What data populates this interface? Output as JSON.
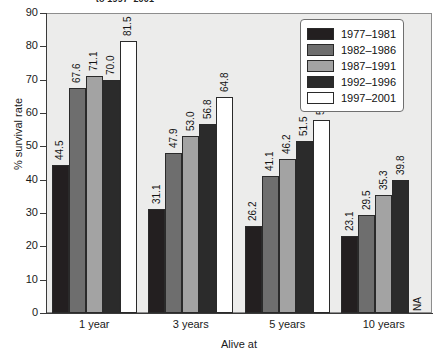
{
  "top_caption": "to 1997–2001",
  "chart_data": {
    "type": "bar",
    "title": "",
    "xlabel": "Alive at",
    "ylabel": "% survival rate",
    "ylim": [
      0,
      90
    ],
    "ytick_step": 10,
    "yticks": [
      "0",
      "10",
      "20",
      "30",
      "40",
      "50",
      "60",
      "70",
      "80",
      "90"
    ],
    "grid": false,
    "legend_position": "top-right",
    "categories": [
      "1 year",
      "3 years",
      "5 years",
      "10 years"
    ],
    "series": [
      {
        "name": "1977–1981",
        "color": "#231f20",
        "values": [
          44.5,
          31.1,
          26.2,
          23.1
        ],
        "labels": [
          "44.5",
          "31.1",
          "26.2",
          "23.1"
        ]
      },
      {
        "name": "1982–1986",
        "color": "#6e6e6e",
        "values": [
          67.6,
          47.9,
          41.1,
          29.5
        ],
        "labels": [
          "67.6",
          "47.9",
          "41.1",
          "29.5"
        ]
      },
      {
        "name": "1987–1991",
        "color": "#a3a3a3",
        "values": [
          71.1,
          53.0,
          46.2,
          35.3
        ],
        "labels": [
          "71.1",
          "53.0",
          "46.2",
          "35.3"
        ]
      },
      {
        "name": "1992–1996",
        "color": "#2b2b2b",
        "values": [
          70.0,
          56.8,
          51.5,
          39.8
        ],
        "labels": [
          "70.0",
          "56.8",
          "51.5",
          "39.8"
        ]
      },
      {
        "name": "1997–2001",
        "color": "#ffffff",
        "values": [
          81.5,
          64.8,
          58.0,
          null
        ],
        "labels": [
          "81.5",
          "64.8",
          "58.0",
          "NA"
        ]
      }
    ],
    "missing_label": "NA"
  },
  "legend": {
    "entries": [
      {
        "label": "1977–1981",
        "color": "#231f20"
      },
      {
        "label": "1982–1986",
        "color": "#6e6e6e"
      },
      {
        "label": "1987–1991",
        "color": "#a3a3a3"
      },
      {
        "label": "1992–1996",
        "color": "#2b2b2b"
      },
      {
        "label": "1997–2001",
        "color": "#ffffff"
      }
    ]
  },
  "colors": {
    "plot_background": "#ececeb",
    "axis": "#3a3a3a",
    "bar_outline": "#2a2a2a",
    "page_background": "#ffffff"
  }
}
